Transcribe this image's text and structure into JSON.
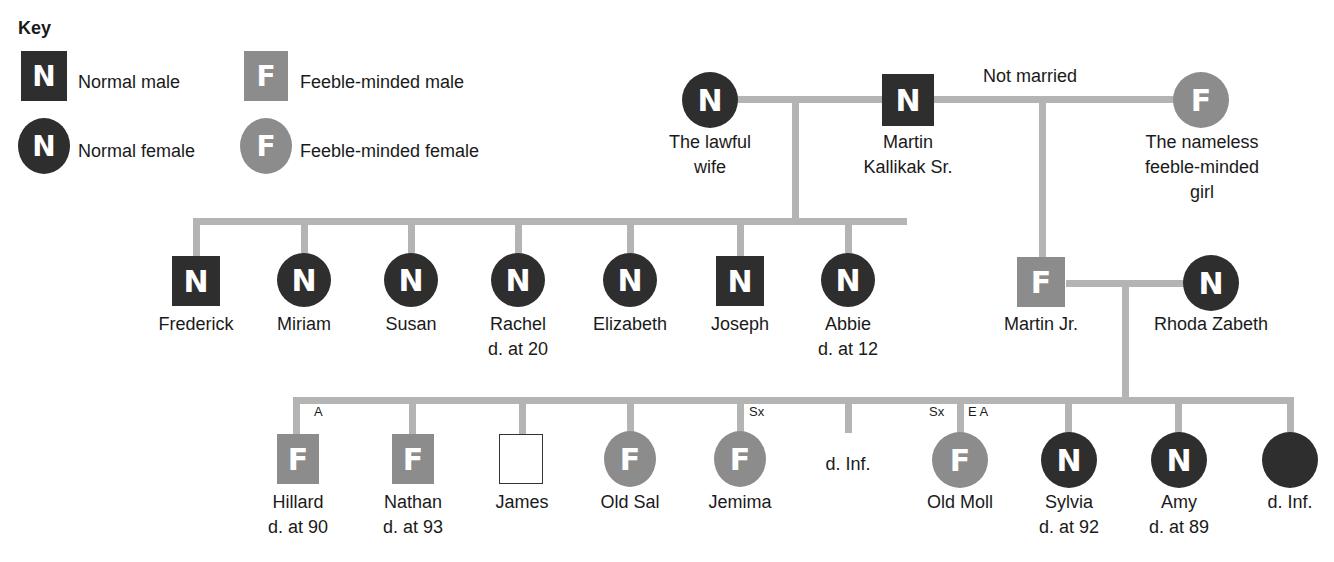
{
  "key": {
    "title": "Key",
    "items": [
      {
        "symbol": "N",
        "shape": "square",
        "tone": "dark",
        "label": "Normal male"
      },
      {
        "symbol": "F",
        "shape": "square",
        "tone": "grey",
        "label": "Feeble-minded male"
      },
      {
        "symbol": "N",
        "shape": "circle",
        "tone": "dark",
        "label": "Normal female"
      },
      {
        "symbol": "F",
        "shape": "circle",
        "tone": "grey",
        "label": "Feeble-minded female"
      }
    ]
  },
  "colors": {
    "normal": "#2e2e2e",
    "feeble": "#8c8c8c",
    "line": "#b4b4b4"
  },
  "generation1": {
    "not_married_label": "Not married",
    "lawful_wife": {
      "symbol": "N",
      "label1": "The lawful",
      "label2": "wife"
    },
    "martin_sr": {
      "symbol": "N",
      "label1": "Martin",
      "label2": "Kallikak Sr."
    },
    "nameless_girl": {
      "symbol": "F",
      "label1": "The nameless",
      "label2": "feeble-minded",
      "label3": "girl"
    }
  },
  "legitimate_children": [
    {
      "symbol": "N",
      "name": "Frederick",
      "note": ""
    },
    {
      "symbol": "N",
      "name": "Miriam",
      "note": ""
    },
    {
      "symbol": "N",
      "name": "Susan",
      "note": ""
    },
    {
      "symbol": "N",
      "name": "Rachel",
      "note": "d. at 20"
    },
    {
      "symbol": "N",
      "name": "Elizabeth",
      "note": ""
    },
    {
      "symbol": "N",
      "name": "Joseph",
      "note": ""
    },
    {
      "symbol": "N",
      "name": "Abbie",
      "note": "d. at 12"
    }
  ],
  "martin_jr": {
    "symbol": "F",
    "name": "Martin Jr."
  },
  "rhoda": {
    "symbol": "N",
    "name": "Rhoda Zabeth"
  },
  "illegitimate_grandchildren": [
    {
      "symbol": "F",
      "name": "Hillard",
      "note": "d. at 90",
      "tag": "A"
    },
    {
      "symbol": "F",
      "name": "Nathan",
      "note": "d. at 93",
      "tag": ""
    },
    {
      "symbol": "",
      "name": "James",
      "note": "",
      "tag": ""
    },
    {
      "symbol": "F",
      "name": "Old Sal",
      "note": "",
      "tag": ""
    },
    {
      "symbol": "F",
      "name": "Jemima",
      "note": "",
      "tag": "Sx"
    },
    {
      "symbol": "",
      "name": "d. Inf.",
      "note": "",
      "tag": ""
    },
    {
      "symbol": "F",
      "name": "Old Moll",
      "note": "",
      "tag_left": "Sx",
      "tag_right": "E A"
    },
    {
      "symbol": "N",
      "name": "Sylvia",
      "note": "d. at 92",
      "tag": ""
    },
    {
      "symbol": "N",
      "name": "Amy",
      "note": "d. at 89",
      "tag": ""
    },
    {
      "symbol": "",
      "name": "d. Inf.",
      "note": "",
      "tag": ""
    }
  ]
}
